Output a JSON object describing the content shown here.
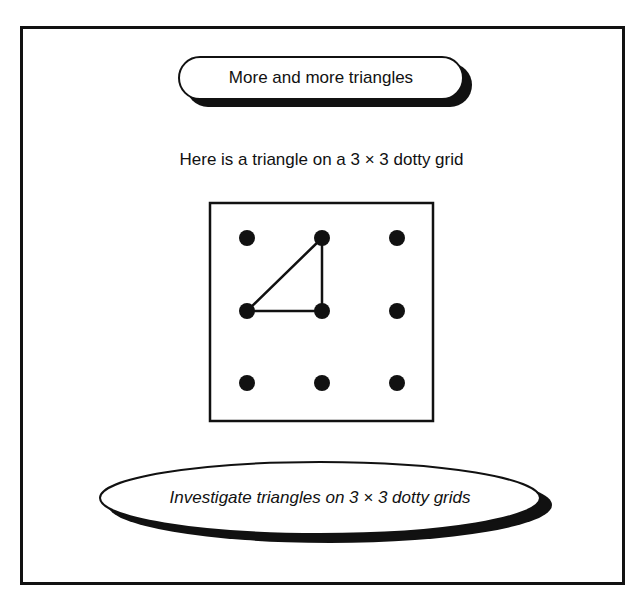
{
  "header": {
    "title": "More and more triangles"
  },
  "intro": {
    "text": "Here is a triangle on a 3 × 3 dotty grid"
  },
  "grid": {
    "rows": 3,
    "cols": 3,
    "dots": [
      {
        "col": 0,
        "row": 0
      },
      {
        "col": 1,
        "row": 0
      },
      {
        "col": 2,
        "row": 0
      },
      {
        "col": 0,
        "row": 1
      },
      {
        "col": 1,
        "row": 1
      },
      {
        "col": 2,
        "row": 1
      },
      {
        "col": 0,
        "row": 2
      },
      {
        "col": 1,
        "row": 2
      },
      {
        "col": 2,
        "row": 2
      }
    ],
    "triangle": [
      {
        "col": 1,
        "row": 0
      },
      {
        "col": 0,
        "row": 1
      },
      {
        "col": 1,
        "row": 1
      }
    ]
  },
  "task": {
    "text": "Investigate triangles on 3 × 3 dotty grids"
  },
  "colors": {
    "ink": "#111111",
    "background": "#ffffff"
  }
}
